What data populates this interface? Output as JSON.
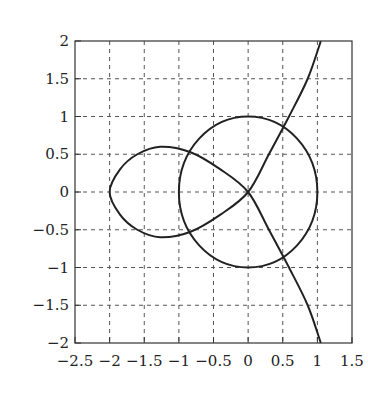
{
  "chart_data": {
    "type": "line",
    "title": "",
    "xlabel": "",
    "ylabel": "",
    "xlim": [
      -2.5,
      1.5
    ],
    "ylim": [
      -2,
      2
    ],
    "grid": true,
    "grid_style": "dashed",
    "legend": null,
    "x_ticks": [
      "−2.5",
      "−2",
      "−1.5",
      "−1",
      "−0.5",
      "0",
      "0.5",
      "1",
      "1.5"
    ],
    "x_tick_values": [
      -2.5,
      -2,
      -1.5,
      -1,
      -0.5,
      0,
      0.5,
      1,
      1.5
    ],
    "y_ticks": [
      "2",
      "1.5",
      "1",
      "0.5",
      "0",
      "−0.5",
      "−1",
      "−1.5",
      "−2"
    ],
    "y_tick_values": [
      2,
      1.5,
      1,
      0.5,
      0,
      -0.5,
      -1,
      -1.5,
      -2
    ],
    "series": [
      {
        "name": "unit circle",
        "description": "circle of radius 1 centred at origin",
        "color": "#222222",
        "points": [
          [
            1,
            0
          ],
          [
            0.924,
            0.383
          ],
          [
            0.707,
            0.707
          ],
          [
            0.383,
            0.924
          ],
          [
            0,
            1
          ],
          [
            -0.383,
            0.924
          ],
          [
            -0.707,
            0.707
          ],
          [
            -0.924,
            0.383
          ],
          [
            -1,
            0
          ],
          [
            -0.924,
            -0.383
          ],
          [
            -0.707,
            -0.707
          ],
          [
            -0.383,
            -0.924
          ],
          [
            0,
            -1
          ],
          [
            0.383,
            -0.924
          ],
          [
            0.707,
            -0.707
          ],
          [
            0.924,
            -0.383
          ],
          [
            1,
            0
          ]
        ]
      },
      {
        "name": "nodal curve",
        "description": "curve with a loop on the left and two branches through the origin",
        "color": "#222222",
        "points": [
          [
            1.05,
            -2
          ],
          [
            0.86,
            -1.5
          ],
          [
            0.59,
            -1
          ],
          [
            0.3,
            -0.5
          ],
          [
            0,
            0
          ],
          [
            -0.4,
            0.3
          ],
          [
            -0.84,
            0.53
          ],
          [
            -1.27,
            0.6
          ],
          [
            -1.6,
            0.5
          ],
          [
            -1.85,
            0.3
          ],
          [
            -2,
            0
          ],
          [
            -1.85,
            -0.3
          ],
          [
            -1.6,
            -0.5
          ],
          [
            -1.27,
            -0.6
          ],
          [
            -0.84,
            -0.53
          ],
          [
            -0.4,
            -0.3
          ],
          [
            0,
            0
          ],
          [
            0.3,
            0.5
          ],
          [
            0.59,
            1
          ],
          [
            0.86,
            1.5
          ],
          [
            1.05,
            2
          ]
        ]
      }
    ]
  }
}
